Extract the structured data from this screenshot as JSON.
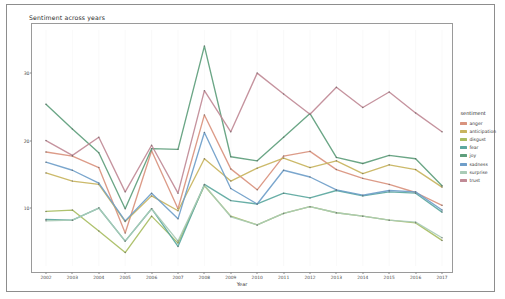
{
  "title": "Sentiment across years",
  "axis": {
    "xlabel": "Year",
    "ylabel": "Mean sentiment score"
  },
  "legend": {
    "title": "sentiment"
  },
  "chart_data": {
    "type": "line",
    "title": "Sentiment across years",
    "xlabel": "Year",
    "ylabel": "Mean sentiment score",
    "grid": false,
    "legend_position": "right",
    "legend_title": "sentiment",
    "x": [
      2002,
      2003,
      2004,
      2005,
      2006,
      2007,
      2008,
      2009,
      2010,
      2011,
      2012,
      2013,
      2014,
      2015,
      2016,
      2017
    ],
    "xlim": [
      2002,
      2017
    ],
    "ylim": [
      2.0,
      35.5
    ],
    "yticks": [
      10,
      20,
      30
    ],
    "xticks": [
      2002,
      2003,
      2004,
      2005,
      2006,
      2007,
      2008,
      2009,
      2010,
      2011,
      2012,
      2013,
      2014,
      2015,
      2016,
      2017
    ],
    "series": [
      {
        "name": "anger",
        "color": "#d9937e",
        "values": [
          18.3,
          17.7,
          16.0,
          6.3,
          18.5,
          9.9,
          23.8,
          15.8,
          12.7,
          17.7,
          18.4,
          15.7,
          14.4,
          13.5,
          12.3,
          10.4
        ]
      },
      {
        "name": "anticipation",
        "color": "#c8b45e",
        "values": [
          15.2,
          14.0,
          13.5,
          8.0,
          11.8,
          9.6,
          17.3,
          14.0,
          15.9,
          17.4,
          16.0,
          17.0,
          15.1,
          16.4,
          15.7,
          13.1
        ]
      },
      {
        "name": "disgust",
        "color": "#a8bd62",
        "values": [
          9.5,
          9.7,
          6.6,
          3.4,
          8.8,
          4.8,
          13.3,
          8.8,
          7.5,
          9.2,
          10.2,
          9.3,
          8.8,
          8.2,
          7.8,
          5.2
        ]
      },
      {
        "name": "fear",
        "color": "#5ca8a0",
        "values": [
          8.3,
          8.2,
          10.0,
          5.1,
          9.9,
          4.3,
          13.5,
          11.1,
          10.6,
          12.2,
          11.5,
          12.6,
          11.8,
          12.4,
          12.2,
          9.4
        ]
      },
      {
        "name": "joy",
        "color": "#5e9e7c",
        "values": [
          25.4,
          21.7,
          18.2,
          9.9,
          18.8,
          18.7,
          34.0,
          17.6,
          17.0,
          20.5,
          24.0,
          17.5,
          16.6,
          17.8,
          17.3,
          13.3
        ]
      },
      {
        "name": "sadness",
        "color": "#6f9ec9",
        "values": [
          16.8,
          15.6,
          13.7,
          8.1,
          12.2,
          8.4,
          21.2,
          12.9,
          10.6,
          15.6,
          14.6,
          12.7,
          11.9,
          12.6,
          12.4,
          9.7
        ]
      },
      {
        "name": "surprise",
        "color": "#a9cbb6",
        "values": [
          8.1,
          8.2,
          10.0,
          5.1,
          9.9,
          5.1,
          13.4,
          8.7,
          7.5,
          9.2,
          10.2,
          9.3,
          8.8,
          8.2,
          7.9,
          5.6
        ]
      },
      {
        "name": "trust",
        "color": "#c08a96",
        "values": [
          20.0,
          17.8,
          20.5,
          12.4,
          19.3,
          12.2,
          27.4,
          21.3,
          30.0,
          26.9,
          23.9,
          27.9,
          24.9,
          27.2,
          24.1,
          21.3
        ]
      }
    ]
  }
}
